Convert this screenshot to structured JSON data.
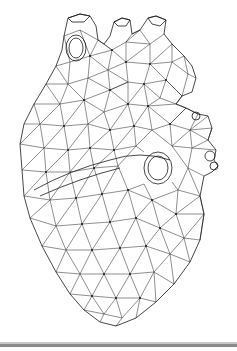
{
  "image": {
    "subject": "wireframe-heart",
    "description": "Low-poly triangulated wireframe mesh of an anatomical human heart, black lines on white background",
    "colors": {
      "background": "#ffffff",
      "mesh_stroke": "#1a1a1a",
      "bottom_bar": "#8a8a8a"
    }
  }
}
